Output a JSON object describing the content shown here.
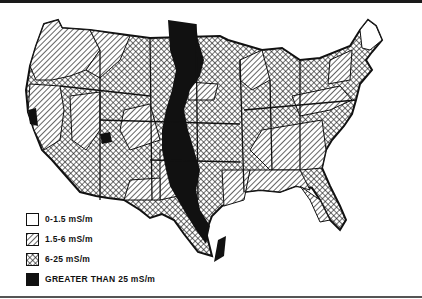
{
  "map": {
    "subject": "Ground conductivity of the contiguous United States",
    "colors": {
      "ink": "#111111",
      "paper": "#ffffff"
    }
  },
  "legend": {
    "items": [
      {
        "label": "0-1.5 mS/m",
        "pattern": "blank"
      },
      {
        "label": "1.5-6 mS/m",
        "pattern": "diagonal-hatch"
      },
      {
        "label": "6-25 mS/m",
        "pattern": "cross-hatch"
      },
      {
        "label": "GREATER THAN 25 mS/m",
        "pattern": "solid-black"
      }
    ]
  }
}
